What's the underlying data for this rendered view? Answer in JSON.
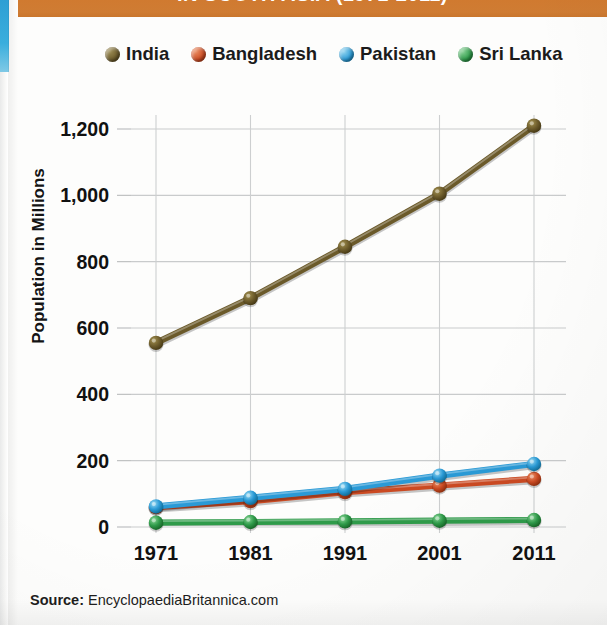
{
  "header": {
    "title": "IN SOUTH ASIA (1971-2011)",
    "band_color": "#cf7c33"
  },
  "legend": {
    "position": "top",
    "items": [
      {
        "label": "India",
        "color": "#6b5a2a"
      },
      {
        "label": "Bangladesh",
        "color": "#cb4a22"
      },
      {
        "label": "Pakistan",
        "color": "#2a9ad6"
      },
      {
        "label": "Sri Lanka",
        "color": "#2f9b4a"
      }
    ]
  },
  "axes": {
    "ylabel": "Population in Millions",
    "yticks": [
      "0",
      "200",
      "400",
      "600",
      "800",
      "1,000",
      "1,200"
    ],
    "xticks": [
      "1971",
      "1981",
      "1991",
      "2001",
      "2011"
    ]
  },
  "source": {
    "label": "Source:",
    "value": "EncyclopaediaBritannica.com"
  },
  "chart_data": {
    "type": "line",
    "title": "IN SOUTH ASIA (1971-2011)",
    "xlabel": "",
    "ylabel": "Population in Millions",
    "x": [
      1971,
      1981,
      1991,
      2001,
      2011
    ],
    "categories": [
      "1971",
      "1981",
      "1991",
      "2001",
      "2011"
    ],
    "ylim": [
      0,
      1200
    ],
    "ytick_values": [
      0,
      200,
      400,
      600,
      800,
      1000,
      1200
    ],
    "grid": true,
    "legend_position": "top",
    "series": [
      {
        "name": "India",
        "color": "#6b5a2a",
        "values": [
          555,
          690,
          845,
          1005,
          1210
        ]
      },
      {
        "name": "Bangladesh",
        "color": "#cb4a22",
        "values": [
          60,
          78,
          105,
          125,
          145
        ]
      },
      {
        "name": "Pakistan",
        "color": "#2a9ad6",
        "values": [
          62,
          88,
          115,
          155,
          190
        ]
      },
      {
        "name": "Sri Lanka",
        "color": "#2f9b4a",
        "values": [
          13,
          15,
          17,
          19,
          21
        ]
      }
    ],
    "source": "EncyclopaediaBritannica.com"
  }
}
